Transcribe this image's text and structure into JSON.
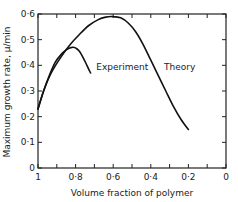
{
  "chart_data": {
    "type": "line",
    "title": "",
    "xlabel": "Volume fraction of polymer",
    "ylabel": "Maximum growth rate, μ/min",
    "xlim": [
      1,
      0
    ],
    "ylim": [
      0,
      0.6
    ],
    "x_reversed": true,
    "x_ticks": [
      1,
      0.9,
      0.8,
      0.7,
      0.6,
      0.5,
      0.4,
      0.3,
      0.2,
      0.1,
      0
    ],
    "x_tick_labels": [
      {
        "value": 1,
        "label": "1"
      },
      {
        "value": 0.8,
        "label": "0·8"
      },
      {
        "value": 0.6,
        "label": "0·6"
      },
      {
        "value": 0.4,
        "label": "0·4"
      },
      {
        "value": 0.2,
        "label": "0·2"
      },
      {
        "value": 0,
        "label": "0"
      }
    ],
    "y_ticks": [
      0,
      0.1,
      0.2,
      0.3,
      0.4,
      0.5,
      0.6
    ],
    "y_tick_labels": [
      {
        "value": 0,
        "label": "0"
      },
      {
        "value": 0.1,
        "label": "0·1"
      },
      {
        "value": 0.2,
        "label": "0·2"
      },
      {
        "value": 0.3,
        "label": "0·3"
      },
      {
        "value": 0.4,
        "label": "0·4"
      },
      {
        "value": 0.5,
        "label": "0·5"
      },
      {
        "value": 0.6,
        "label": "0·6"
      }
    ],
    "grid": false,
    "legend": "none",
    "series": [
      {
        "name": "Theory",
        "x": [
          1.0,
          0.97,
          0.93,
          0.88,
          0.83,
          0.78,
          0.73,
          0.68,
          0.64,
          0.6,
          0.56,
          0.52,
          0.48,
          0.44,
          0.4,
          0.36,
          0.32,
          0.28,
          0.24,
          0.2
        ],
        "y": [
          0.23,
          0.3,
          0.37,
          0.43,
          0.48,
          0.52,
          0.555,
          0.578,
          0.588,
          0.59,
          0.585,
          0.565,
          0.53,
          0.48,
          0.42,
          0.36,
          0.3,
          0.24,
          0.19,
          0.15
        ]
      },
      {
        "name": "Experiment",
        "x": [
          1.0,
          0.97,
          0.94,
          0.91,
          0.88,
          0.85,
          0.82,
          0.8,
          0.78,
          0.76,
          0.74,
          0.72
        ],
        "y": [
          0.23,
          0.3,
          0.36,
          0.41,
          0.44,
          0.46,
          0.47,
          0.468,
          0.455,
          0.43,
          0.4,
          0.37
        ]
      }
    ],
    "annotations": [
      {
        "text": "Experiment",
        "x": 0.69,
        "y": 0.38,
        "target": "Experiment"
      },
      {
        "text": "Theory",
        "x": 0.33,
        "y": 0.38,
        "target": "Theory"
      }
    ]
  }
}
